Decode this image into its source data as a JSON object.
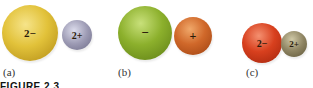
{
  "figure": {
    "caption": "FIGURE 2.3",
    "panels": [
      {
        "label": "(a)",
        "anion": {
          "charge": "2−",
          "color": "#e2c23a",
          "highlight": "#f6e48a",
          "shade": "#b08a14"
        },
        "cation": {
          "charge": "2+",
          "color": "#9d9bb4",
          "highlight": "#dcdcec",
          "shade": "#6c6a86"
        }
      },
      {
        "label": "(b)",
        "anion": {
          "charge": "−",
          "color": "#8cb02c",
          "highlight": "#c8e07a",
          "shade": "#5c7c14"
        },
        "cation": {
          "charge": "+",
          "color": "#d0682a",
          "highlight": "#f0a86a",
          "shade": "#9c4010"
        }
      },
      {
        "label": "(c)",
        "anion": {
          "charge": "2−",
          "color": "#d8401e",
          "highlight": "#f49070",
          "shade": "#a0240c"
        },
        "cation": {
          "charge": "2+",
          "color": "#8e8462",
          "highlight": "#cfc8a6",
          "shade": "#5e5638"
        }
      }
    ]
  }
}
